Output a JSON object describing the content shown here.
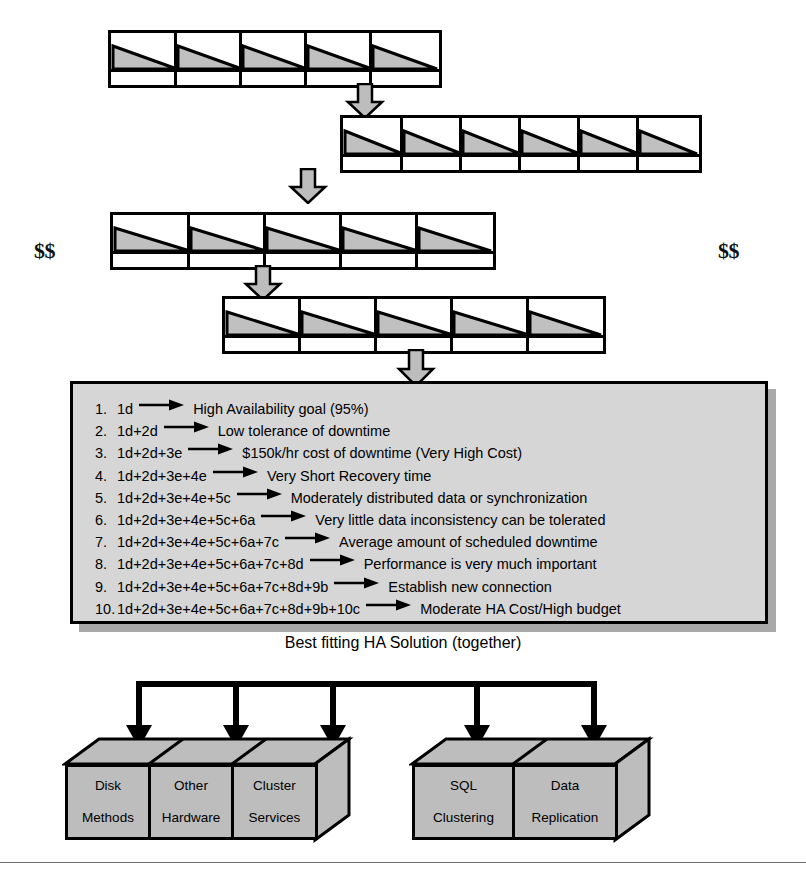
{
  "colors": {
    "triangle_fill": "#c0c0c0",
    "arrow_gray": "#bdbdbd",
    "list_box_fill": "#d6d6d6",
    "box_fill": "#bdbdbd",
    "shadow": "#a9a9a9",
    "outline": "#000000"
  },
  "money_left": "$$",
  "money_right": "$$",
  "funnel": {
    "bars": [
      {
        "cells": 5
      },
      {
        "cells": 6
      },
      {
        "cells": 5
      },
      {
        "cells": 5
      }
    ]
  },
  "results": {
    "items": [
      {
        "num": "1.",
        "code": "1d",
        "arrow": "right-arrow",
        "text": "High Availability goal (95%)"
      },
      {
        "num": "2.",
        "code": "1d+2d",
        "arrow": "right-arrow",
        "text": "Low tolerance of downtime"
      },
      {
        "num": "3.",
        "code": "1d+2d+3e",
        "arrow": "right-arrow",
        "text": "$150k/hr cost of downtime (Very High Cost)"
      },
      {
        "num": "4.",
        "code": "1d+2d+3e+4e",
        "arrow": "right-arrow",
        "text": "Very Short Recovery time"
      },
      {
        "num": "5.",
        "code": "1d+2d+3e+4e+5c",
        "arrow": "right-arrow",
        "text": "Moderately distributed data or synchronization"
      },
      {
        "num": "6.",
        "code": "1d+2d+3e+4e+5c+6a",
        "arrow": "right-arrow",
        "text": "Very little data inconsistency can be tolerated"
      },
      {
        "num": "7.",
        "code": "1d+2d+3e+4e+5c+6a+7c",
        "arrow": "right-arrow",
        "text": "Average amount of scheduled downtime"
      },
      {
        "num": "8.",
        "code": "1d+2d+3e+4e+5c+6a+7c+8d",
        "arrow": "right-arrow",
        "text": "Performance is very much important"
      },
      {
        "num": "9.",
        "code": "1d+2d+3e+4e+5c+6a+7c+8d+9b",
        "arrow": "right-arrow",
        "text": "Establish new connection"
      },
      {
        "num": "10.",
        "code": "1d+2d+3e+4e+5c+6a+7c+8d+9b+10c",
        "arrow": "right-arrow",
        "text": "Moderate HA Cost/High budget"
      }
    ]
  },
  "caption": "Best fitting HA Solution (together)",
  "solutions": {
    "left_group": [
      {
        "line1": "Disk",
        "line2": "Methods"
      },
      {
        "line1": "Other",
        "line2": "Hardware"
      },
      {
        "line1": "Cluster",
        "line2": "Services"
      }
    ],
    "right_group": [
      {
        "line1": "SQL",
        "line2": "Clustering"
      },
      {
        "line1": "Data",
        "line2": "Replication"
      }
    ]
  }
}
